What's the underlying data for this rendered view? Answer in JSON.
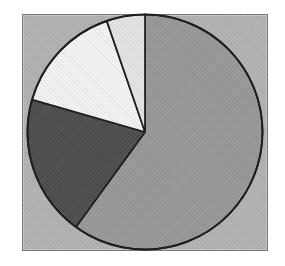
{
  "figure": {
    "background_color": "#b5b5b5",
    "frame_border_color": "#7a7a7a",
    "outline_color": "#1c1c1c",
    "page_color": "#ffffff"
  },
  "chart_data": {
    "type": "pie",
    "title": "",
    "xlabel": "",
    "ylabel": "",
    "legend": false,
    "data_labels_visible": false,
    "start_angle_deg": 90,
    "direction": "clockwise",
    "slices": [
      {
        "name": "medium-gray-slice",
        "sweep_deg": 216,
        "percent": 60.0,
        "color": "#9a9a9a"
      },
      {
        "name": "dark-gray-slice",
        "sweep_deg": 70,
        "percent": 19.4,
        "color": "#4e4e4e"
      },
      {
        "name": "white-slice",
        "sweep_deg": 55,
        "percent": 15.3,
        "color": "#f6f6f4"
      },
      {
        "name": "light-gray-slice",
        "sweep_deg": 19,
        "percent": 5.3,
        "color": "#e7e7e5"
      }
    ]
  }
}
